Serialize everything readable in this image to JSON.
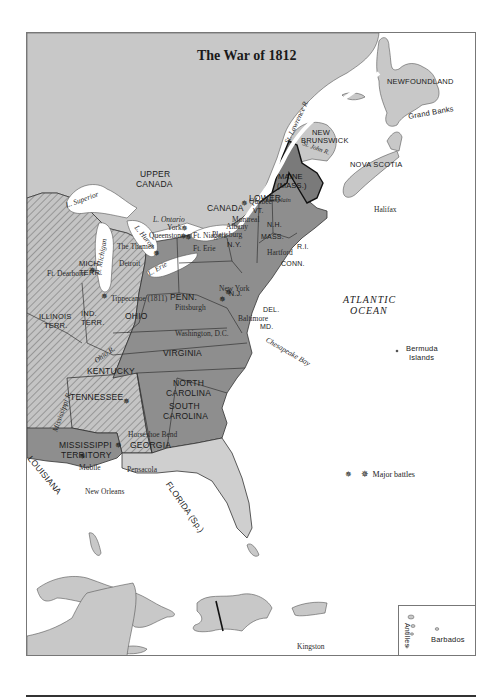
{
  "map": {
    "title": "The War of 1812",
    "colors": {
      "canada_land": "#c8c8c8",
      "us_states": "#8e8e8e",
      "new_england": "#7a7a7a",
      "territories_hatch": "#b9b9b9",
      "spanish_florida": "#cfcfcf",
      "water": "#ffffff",
      "border": "#333333"
    },
    "regions": {
      "newfoundland": "NEWFOUNDLAND",
      "grand_banks": "Grand Banks",
      "new_brunswick_1": "NEW",
      "new_brunswick_2": "BRUNSWICK",
      "nova_scotia": "NOVA SCOTIA",
      "lower_canada_1": "LOWER",
      "lower_canada_2": "CANADA",
      "upper_canada_1": "UPPER",
      "upper_canada_2": "CANADA",
      "maine_1": "MAINE",
      "maine_2": "(MASS.)",
      "vt": "VT.",
      "nh": "N.H.",
      "mass": "MASS.",
      "ri": "R.I.",
      "conn": "CONN.",
      "ny": "N.Y.",
      "nj": "N.J.",
      "del": "DEL.",
      "md": "MD.",
      "penn": "PENN.",
      "ohio": "OHIO",
      "mich_terr_1": "MICH.",
      "mich_terr_2": "TERR.",
      "ind_terr_1": "IND.",
      "ind_terr_2": "TERR.",
      "illinois_terr_1": "ILLINOIS",
      "illinois_terr_2": "TERR.",
      "virginia": "VIRGINIA",
      "kentucky": "KENTUCKY",
      "tennessee": "TENNESSEE",
      "north_carolina_1": "NORTH",
      "north_carolina_2": "CAROLINA",
      "south_carolina_1": "SOUTH",
      "south_carolina_2": "CAROLINA",
      "georgia": "GEORGIA",
      "mississippi_terr_1": "MISSISSIPPI",
      "mississippi_terr_2": "TERRITORY",
      "louisiana": "LOUISIANA",
      "florida": "FLORIDA (Sp.)",
      "atlantic_1": "ATLANTIC",
      "atlantic_2": "OCEAN",
      "bermuda_1": "Bermuda",
      "bermuda_2": "Islands",
      "jamaica": "Jamaica",
      "antilles": "Antilles",
      "barbados": "Barbados"
    },
    "cities": {
      "quebec": "Quebec",
      "montreal": "Montreal",
      "halifax": "Halifax",
      "plattsburg": "Plattsburg",
      "albany": "Albany",
      "york": "York",
      "queenston": "Queenston",
      "ft_niagara": "Ft. Niagara",
      "ft_erie": "Ft. Erie",
      "the_thames": "The Thames",
      "detroit": "Detroit",
      "ft_dearborn": "Ft. Dearborn",
      "tippecanoe": "Tippecanoe (1811)",
      "hartford": "Hartford",
      "new_york": "New York",
      "pittsburgh": "Pittsburgh",
      "baltimore": "Baltimore",
      "washington": "Washington, D.C.",
      "horseshoe_bend": "Horseshoe Bend",
      "mobile": "Mobile",
      "pensacola": "Pensacola",
      "new_orleans": "New Orleans",
      "kingston": "Kingston"
    },
    "waters": {
      "st_lawrence": "St. Lawrence R.",
      "st_john": "St. John R.",
      "l_superior": "L. Superior",
      "l_michigan": "L. Michigan",
      "l_huron": "L. Huron",
      "l_ontario": "L. Ontario",
      "l_erie": "L. Erie",
      "l_champlain": "L. Champlain",
      "ohio_r": "Ohio R.",
      "mississippi_r": "Mississippi R.",
      "chesapeake": "Chesapeake Bay"
    },
    "legend": {
      "icon": "battle-star-icon",
      "label": "Major battles"
    },
    "battles": [
      "Plattsburg",
      "York",
      "Queenston",
      "Ft. Niagara",
      "The Thames",
      "Ft. Dearborn",
      "Tippecanoe",
      "Baltimore",
      "Washington, D.C.",
      "Horseshoe Bend",
      "Pensacola",
      "New Orleans"
    ]
  }
}
